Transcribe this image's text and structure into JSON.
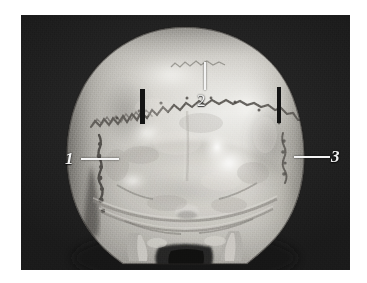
{
  "figure": {
    "kind": "anatomical-photograph",
    "background_color": "#242424",
    "bone_color": "#c9c7c2",
    "annotation_color": "#f2f2f2"
  },
  "annotations": [
    {
      "id": "1",
      "label": "1",
      "name": "label-1",
      "leader": "horizontal-right",
      "points_to": "left lambdoid suture / parietomastoid margin"
    },
    {
      "id": "2",
      "label": "2",
      "name": "label-2",
      "leader": "vertical-up",
      "points_to": "sagittal / lambdoid suture vertex"
    },
    {
      "id": "3",
      "label": "3",
      "name": "label-3",
      "leader": "horizontal-left",
      "points_to": "right lambdoid suture"
    }
  ],
  "reference_marks": [
    {
      "name": "ref-bar-left",
      "orientation": "vertical",
      "color": "#141414"
    },
    {
      "name": "ref-bar-right",
      "orientation": "vertical",
      "color": "#141414"
    }
  ]
}
